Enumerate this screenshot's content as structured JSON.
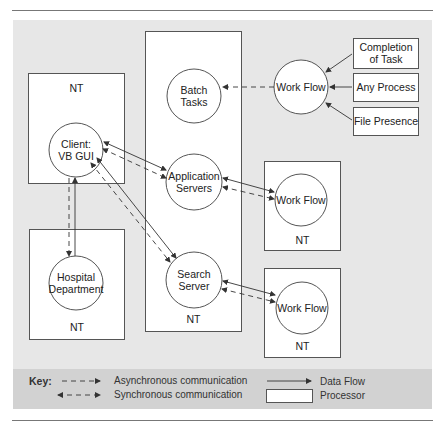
{
  "diagram": {
    "processors": [
      {
        "id": "nt-client",
        "label": "NT"
      },
      {
        "id": "nt-hospital",
        "label": "NT"
      },
      {
        "id": "nt-center",
        "label": "NT"
      },
      {
        "id": "nt-workflow-1",
        "label": "NT"
      },
      {
        "id": "nt-workflow-2",
        "label": "NT"
      }
    ],
    "nodes": {
      "client": {
        "line1": "Client:",
        "line2": "VB GUI"
      },
      "hospital": {
        "line1": "Hospital",
        "line2": "Department"
      },
      "batch": {
        "line1": "Batch",
        "line2": "Tasks"
      },
      "app_servers": {
        "line1": "Application",
        "line2": "Servers"
      },
      "search_server": {
        "line1": "Search",
        "line2": "Server"
      },
      "workflow_top": {
        "label": "Work Flow"
      },
      "workflow_1": {
        "label": "Work Flow"
      },
      "workflow_2": {
        "label": "Work Flow"
      }
    },
    "triggers": {
      "completion": {
        "line1": "Completion",
        "line2": "of Task"
      },
      "any_process": {
        "label": "Any Process"
      },
      "file_presence": {
        "label": "File Presence"
      }
    },
    "edges": [
      {
        "from": "Work Flow",
        "to": "Batch Tasks",
        "type": "asynchronous"
      },
      {
        "from": "Completion of Task",
        "to": "Work Flow",
        "type": "data-flow"
      },
      {
        "from": "Any Process",
        "to": "Work Flow",
        "type": "data-flow"
      },
      {
        "from": "File Presence",
        "to": "Work Flow",
        "type": "data-flow"
      },
      {
        "from": "Client: VB GUI",
        "to": "Application Servers",
        "type": "synchronous"
      },
      {
        "from": "Client: VB GUI",
        "to": "Search Server",
        "type": "synchronous"
      },
      {
        "from": "Client: VB GUI",
        "to": "Hospital Department",
        "type": "synchronous"
      },
      {
        "from": "Application Servers",
        "to": "Work Flow",
        "type": "synchronous"
      },
      {
        "from": "Search Server",
        "to": "Work Flow",
        "type": "synchronous"
      }
    ]
  },
  "key": {
    "title": "Key:",
    "async_label": "Asynchronous communication",
    "sync_label": "Synchronous communication",
    "dataflow_label": "Data Flow",
    "processor_label": "Processor"
  },
  "colors": {
    "panel": "#e7e7e7",
    "key_band": "#d2d2d2",
    "stroke": "#444444"
  }
}
